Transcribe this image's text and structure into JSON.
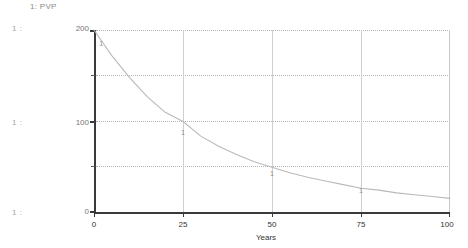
{
  "legend": {
    "entry": "1: PVP",
    "index": "1",
    "name": "PVP"
  },
  "series_tags": [
    "1 :",
    "1 :",
    "1 :"
  ],
  "axes": {
    "y_labels": [
      "200",
      "100",
      "0"
    ],
    "x_labels": [
      "0",
      "25",
      "50",
      "75",
      "100"
    ],
    "x_title": "Years"
  },
  "markers": [
    {
      "label": "1",
      "x": 2.0,
      "y": 186
    },
    {
      "label": "1",
      "x": 25.0,
      "y": 88
    },
    {
      "label": "1",
      "x": 50.0,
      "y": 44
    },
    {
      "label": "1",
      "x": 75.0,
      "y": 25
    }
  ],
  "colors": {
    "curve": "#b9b9b9",
    "axis": "#3a3a3a",
    "grid_horizontal": "#b5b5b5",
    "grid_vertical": "#cfcfcf",
    "text": "#333333",
    "muted_text": "#8a8a8a",
    "background": "#ffffff"
  },
  "chart_data": {
    "type": "line",
    "title": "",
    "subtitle": "",
    "xlabel": "Years",
    "ylabel": "",
    "xlim": [
      0,
      100
    ],
    "ylim": [
      0,
      200
    ],
    "xticks": [
      0,
      25,
      50,
      75,
      100
    ],
    "yticks": [
      0,
      50,
      100,
      150,
      200
    ],
    "ytick_labels": [
      "0",
      "",
      "100",
      "",
      "200"
    ],
    "grid": true,
    "grid_horizontal_style": "dotted",
    "grid_vertical_style": "solid",
    "legend": [
      "1: PVP"
    ],
    "legend_position": "top-left",
    "series": [
      {
        "name": "PVP",
        "index": 1,
        "color": "#b9b9b9",
        "x": [
          0,
          5,
          10,
          15,
          20,
          25,
          30,
          35,
          40,
          45,
          50,
          55,
          60,
          65,
          70,
          75,
          80,
          85,
          90,
          95,
          100
        ],
        "values": [
          200,
          172,
          148,
          127,
          110,
          100,
          84,
          73,
          64,
          56,
          50,
          44,
          39,
          35,
          31,
          27,
          25,
          22,
          20,
          18,
          16
        ]
      }
    ],
    "annotations": [
      {
        "text": "1",
        "x": 2,
        "y": 186
      },
      {
        "text": "1",
        "x": 25,
        "y": 88
      },
      {
        "text": "1",
        "x": 50,
        "y": 44
      },
      {
        "text": "1",
        "x": 75,
        "y": 25
      }
    ]
  }
}
